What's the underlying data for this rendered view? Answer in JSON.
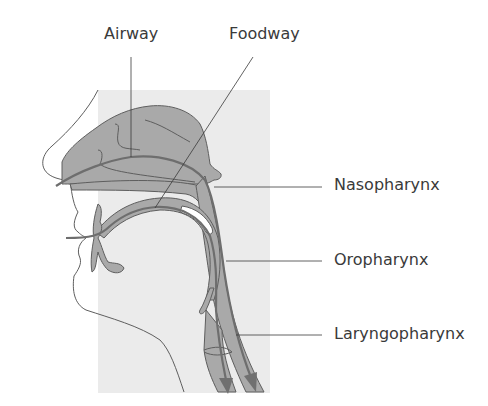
{
  "diagram": {
    "type": "anatomical-cross-section",
    "colors": {
      "background_panel": "#ebebeb",
      "tissue_fill": "#a9a9a9",
      "outline": "#5e5e5e",
      "pathway_line": "#6e6e6e",
      "arrow": "#707070",
      "label_text": "#3a3a3a",
      "leader_line": "#3a3a3a"
    },
    "labels": {
      "airway": "Airway",
      "foodway": "Foodway",
      "nasopharynx": "Nasopharynx",
      "oropharynx": "Oropharynx",
      "laryngopharynx": "Laryngopharynx"
    },
    "arrows": [
      {
        "name": "foodway-arrow",
        "direction": "down"
      },
      {
        "name": "airway-arrow",
        "direction": "down"
      }
    ]
  }
}
